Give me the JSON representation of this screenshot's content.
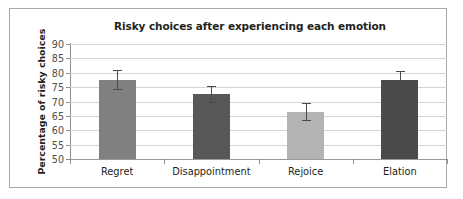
{
  "chart_data": {
    "type": "bar",
    "title": "Risky choices after experiencing each emotion",
    "xlabel": "",
    "ylabel": "Percentage of risky choices",
    "categories": [
      "Regret",
      "Disappointment",
      "Rejoice",
      "Elation"
    ],
    "values": [
      77.6,
      72.6,
      66.4,
      77.5
    ],
    "errors": [
      3.2,
      2.8,
      3.0,
      3.0
    ],
    "error_low": [
      74.4,
      69.8,
      63.4,
      74.5
    ],
    "error_high": [
      80.8,
      75.4,
      69.4,
      80.5
    ],
    "bar_colors": [
      "#808080",
      "#585858",
      "#b4b4b4",
      "#4a4a4a"
    ],
    "ylim": [
      50,
      90
    ],
    "yticks": [
      90,
      85,
      80,
      75,
      70,
      65,
      60,
      55,
      50
    ],
    "ytick_labels": [
      "90",
      "85",
      "80",
      "75",
      "70",
      "65",
      "60",
      "55",
      "50"
    ],
    "grid": true,
    "legend": "none",
    "series": [
      {
        "name": "Percentage of risky choices",
        "values": [
          77.6,
          72.6,
          66.4,
          77.5
        ]
      }
    ]
  }
}
